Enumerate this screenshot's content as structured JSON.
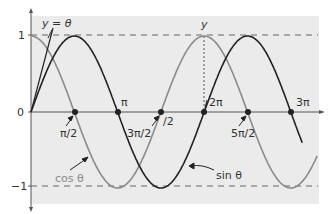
{
  "chart_data": {
    "type": "line",
    "title": "",
    "xlabel": "",
    "ylabel": "",
    "x_range_radians": [
      0,
      9.9
    ],
    "ylim": [
      -1,
      1
    ],
    "y_ticks": [
      "1",
      "0",
      "−1"
    ],
    "x_tick_labels": [
      "π/2",
      "π",
      "3π/2",
      "/2",
      "2π",
      "5π/2",
      "3π"
    ],
    "series": [
      {
        "name": "sin θ",
        "function": "sin",
        "color": "#222222"
      },
      {
        "name": "cos θ",
        "function": "cos",
        "color": "#8a8a8a"
      },
      {
        "name": "y = θ",
        "function": "identity",
        "color": "#222222"
      }
    ],
    "reference_lines": [
      {
        "y": 1,
        "style": "dashed"
      },
      {
        "y": -1,
        "style": "dashed"
      }
    ],
    "marked_points": [
      "π/2",
      "π",
      "3π/2",
      "2π",
      "5π/2",
      "3π"
    ],
    "annotations": [
      "y = θ",
      "y",
      "cos θ",
      "sin θ"
    ],
    "grid": false,
    "legend": "none"
  },
  "labels": {
    "y_one": "1",
    "y_zero": "0",
    "y_neg_one": "−1",
    "line_label": "y = θ",
    "peak_label": "y",
    "pi_half": "π/2",
    "pi": "π",
    "three_pi_half": "3π/2",
    "half_fragment": "/2",
    "two_pi": "2π",
    "five_pi_half": "5π/2",
    "three_pi": "3π",
    "cos_label": "cos θ",
    "sin_label": "sin θ"
  },
  "colors": {
    "background_panel": "#ebebeb",
    "sin_curve": "#222222",
    "cos_curve": "#8a8a8a",
    "axis": "#555555"
  }
}
